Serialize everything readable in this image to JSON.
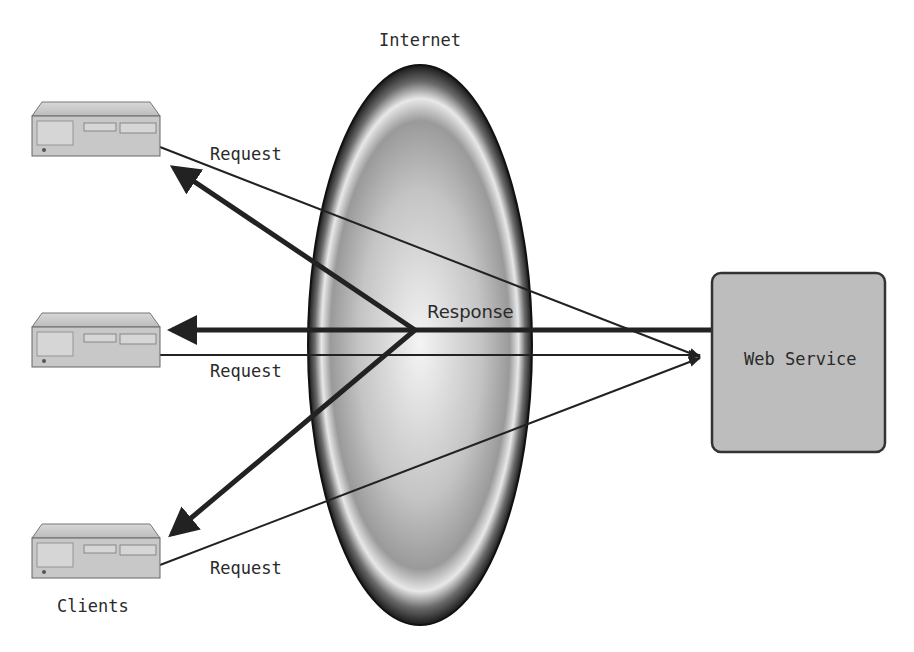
{
  "diagram": {
    "cloud": {
      "label": "Internet"
    },
    "server": {
      "label": "Web Service"
    },
    "clients": {
      "caption": "Clients",
      "items": [
        {
          "id": "client-top",
          "request_label": "Request"
        },
        {
          "id": "client-middle",
          "request_label": "Request"
        },
        {
          "id": "client-bottom",
          "request_label": "Request"
        }
      ]
    },
    "response_label": "Response",
    "colors": {
      "server_fill": "#bdbdbd",
      "server_stroke": "#333333",
      "arrow": "#222222",
      "client_fill": "#c8c8c8"
    }
  }
}
